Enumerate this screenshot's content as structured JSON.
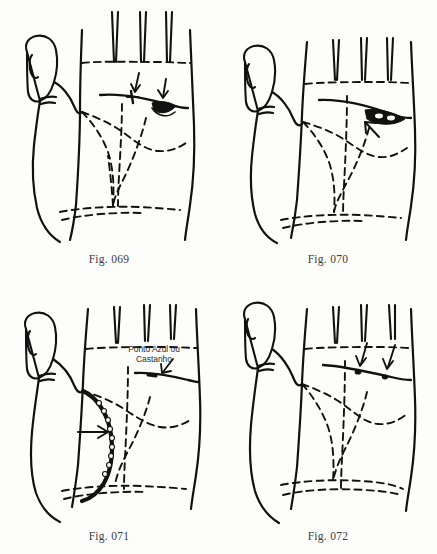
{
  "page": {
    "type": "scanned-book-page",
    "background_color": "#fdfdfb",
    "ink_color": "#111111",
    "width": 437,
    "height": 554
  },
  "figures": [
    {
      "id": "fig-069",
      "caption": "Fig. 069",
      "position": {
        "col": 0,
        "row": 0
      },
      "hand_label": "left palm outline",
      "marking_description": "heart line with cross mark and dark island, two arrows",
      "arrows": 2,
      "annotation": null
    },
    {
      "id": "fig-070",
      "caption": "Fig. 070",
      "position": {
        "col": 1,
        "row": 0
      },
      "hand_label": "left palm outline",
      "marking_description": "heart line with long dark island, one arrow",
      "arrows": 1,
      "annotation": null
    },
    {
      "id": "fig-071",
      "caption": "Fig. 071",
      "position": {
        "col": 0,
        "row": 1
      },
      "hand_label": "left palm outline",
      "marking_description": "chained beaded life line, one arrow; heart line point annotated",
      "arrows": 2,
      "annotation": "Ponto Azul ou\nCastanho"
    },
    {
      "id": "fig-072",
      "caption": "Fig. 072",
      "position": {
        "col": 1,
        "row": 1
      },
      "hand_label": "left palm outline",
      "marking_description": "heart line with two dots, two arrows",
      "arrows": 2,
      "annotation": null
    }
  ]
}
